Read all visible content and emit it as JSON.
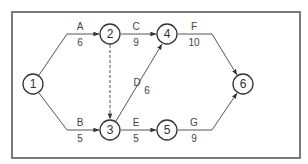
{
  "diagram": {
    "type": "activity-on-arrow network",
    "colors": {
      "frame": "#7a7a7a",
      "edge": "#555555",
      "node_stroke": "#333333",
      "text": "#333333"
    },
    "nodes": [
      {
        "id": "1",
        "label": "1",
        "x": 33,
        "y": 84
      },
      {
        "id": "2",
        "label": "2",
        "x": 110,
        "y": 34
      },
      {
        "id": "3",
        "label": "3",
        "x": 110,
        "y": 130
      },
      {
        "id": "4",
        "label": "4",
        "x": 167,
        "y": 34
      },
      {
        "id": "5",
        "label": "5",
        "x": 167,
        "y": 130
      },
      {
        "id": "6",
        "label": "6",
        "x": 243,
        "y": 84
      }
    ],
    "edges": [
      {
        "from": "1",
        "to": "2",
        "activity": "A",
        "duration": "6",
        "dummy": false
      },
      {
        "from": "1",
        "to": "3",
        "activity": "B",
        "duration": "5",
        "dummy": false
      },
      {
        "from": "2",
        "to": "4",
        "activity": "C",
        "duration": "9",
        "dummy": false
      },
      {
        "from": "3",
        "to": "4",
        "activity": "D",
        "duration": "6",
        "dummy": false
      },
      {
        "from": "3",
        "to": "5",
        "activity": "E",
        "duration": "5",
        "dummy": false
      },
      {
        "from": "4",
        "to": "6",
        "activity": "F",
        "duration": "10",
        "dummy": false
      },
      {
        "from": "5",
        "to": "6",
        "activity": "G",
        "duration": "9",
        "dummy": false
      },
      {
        "from": "2",
        "to": "3",
        "activity": "",
        "duration": "",
        "dummy": true
      }
    ]
  }
}
